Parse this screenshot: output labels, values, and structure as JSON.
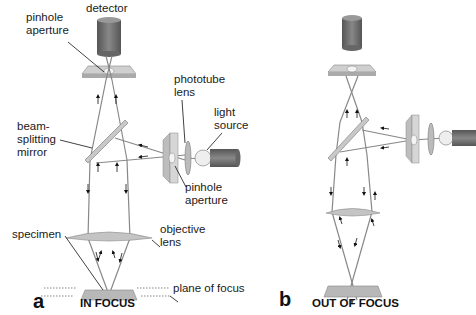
{
  "labels": {
    "detector": "detector",
    "pinhole_aperture_top": "pinhole\naperture",
    "phototube_lens": "phototube\nlens",
    "light_source": "light\nsource",
    "beam_splitting_mirror": "beam-\nsplitting\nmirror",
    "pinhole_aperture_side": "pinhole\naperture",
    "objective_lens": "objective\nlens",
    "specimen": "specimen",
    "plane_of_focus": "plane of focus"
  },
  "panels": [
    {
      "letter": "a",
      "title": "IN FOCUS"
    },
    {
      "letter": "b",
      "title": "OUT OF FOCUS"
    }
  ],
  "colors": {
    "detector": "#6b6b6b",
    "plate": "#b8b8b8",
    "light_ray": "#8a8a8a",
    "lamp": "#e8e8e8"
  }
}
